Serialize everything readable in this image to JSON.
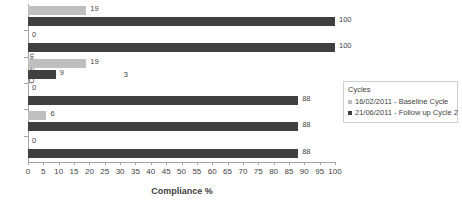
{
  "chart_data": {
    "type": "bar",
    "orientation": "horizontal",
    "title": "",
    "xlabel": "Compliance %",
    "ylabel": "Criterion",
    "categories": [
      "1",
      "2",
      "3",
      "4",
      "5",
      "6"
    ],
    "xlim": [
      0,
      100
    ],
    "xticks": [
      0,
      5,
      10,
      15,
      20,
      25,
      30,
      35,
      40,
      45,
      50,
      55,
      60,
      65,
      70,
      75,
      80,
      85,
      90,
      95,
      100
    ],
    "grid": false,
    "legend_position": "right",
    "legend_title": "Cycles",
    "series": [
      {
        "name": "16/02/2011 - Baseline Cycle",
        "color": "#bfbfbf",
        "values": [
          19,
          0,
          19,
          0,
          6,
          0
        ],
        "labels": [
          "19",
          "0",
          "19",
          "0",
          "6",
          "0"
        ]
      },
      {
        "name": "21/06/2011 - Follow up Cycle 2",
        "color": "#404040",
        "values": [
          100,
          100,
          9,
          88,
          88,
          88
        ],
        "labels": [
          "100",
          "100",
          "9",
          "88",
          "88",
          "88"
        ]
      }
    ]
  },
  "legend": {
    "title": "Cycles",
    "items": [
      {
        "label": "16/02/2011 - Baseline Cycle",
        "marker": "square-light-icon"
      },
      {
        "label": "21/06/2011 - Follow up Cycle 2",
        "marker": "square-dark-icon"
      }
    ]
  },
  "axes": {
    "x_title": "Compliance %",
    "y_title": "Criterion",
    "x_tick_labels": [
      "0",
      "5",
      "10",
      "15",
      "20",
      "25",
      "30",
      "35",
      "40",
      "45",
      "50",
      "55",
      "60",
      "65",
      "70",
      "75",
      "80",
      "85",
      "90",
      "95",
      "100"
    ],
    "y_tick_labels": [
      "1",
      "2",
      "3",
      "4",
      "5",
      "6"
    ]
  }
}
